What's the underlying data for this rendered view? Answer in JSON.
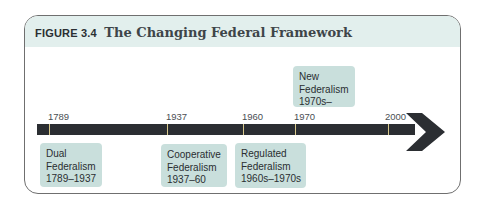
{
  "figure": {
    "label": "FIGURE 3.4",
    "title": "The Changing Federal Framework"
  },
  "timeline": {
    "ticks": [
      {
        "year": "1789"
      },
      {
        "year": "1937"
      },
      {
        "year": "1960"
      },
      {
        "year": "1970"
      },
      {
        "year": "2000"
      }
    ],
    "eras": [
      {
        "line1": "Dual",
        "line2": "Federalism",
        "line3": "1789–1937",
        "position": "below"
      },
      {
        "line1": "Cooperative",
        "line2": "Federalism",
        "line3": "1937–60",
        "position": "below"
      },
      {
        "line1": "Regulated",
        "line2": "Federalism",
        "line3": "1960s–1970s",
        "position": "below"
      },
      {
        "line1": "New",
        "line2": "Federalism",
        "line3": "1970s–",
        "position": "above"
      }
    ]
  },
  "colors": {
    "header_bg": "#e2efed",
    "era_box_bg": "#c9dfdc",
    "arrow": "#2b2e32",
    "tick": "#d8c98c"
  }
}
